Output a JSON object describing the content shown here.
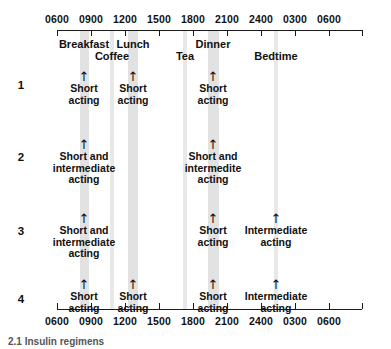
{
  "figure": {
    "caption": "2.1 Insulin regimens"
  },
  "axis": {
    "ticks": [
      {
        "label": "0600",
        "x": 57
      },
      {
        "label": "0900",
        "x": 91
      },
      {
        "label": "1200",
        "x": 125
      },
      {
        "label": "1500",
        "x": 159
      },
      {
        "label": "1800",
        "x": 193
      },
      {
        "label": "2100",
        "x": 227
      },
      {
        "label": "2400",
        "x": 261
      },
      {
        "label": "0300",
        "x": 295
      },
      {
        "label": "0600",
        "x": 329
      }
    ],
    "axis_left": 57,
    "axis_right": 362,
    "top_y": 30,
    "bottom_y": 309
  },
  "meals": [
    {
      "name": "Breakfast",
      "x": 84,
      "row": 0
    },
    {
      "name": "Coffee",
      "x": 112,
      "row": 1
    },
    {
      "name": "Lunch",
      "x": 133,
      "row": 0
    },
    {
      "name": "Tea",
      "x": 185,
      "row": 1
    },
    {
      "name": "Dinner",
      "x": 213,
      "row": 0
    },
    {
      "name": "Bedtime",
      "x": 276,
      "row": 1
    }
  ],
  "bands": [
    {
      "name": "breakfast-band",
      "x": 80,
      "width": 9,
      "tone": "solid"
    },
    {
      "name": "coffee-band",
      "x": 110,
      "width": 4,
      "tone": "soft"
    },
    {
      "name": "lunch-band",
      "x": 128,
      "width": 10,
      "tone": "solid"
    },
    {
      "name": "tea-band",
      "x": 183,
      "width": 4,
      "tone": "soft"
    },
    {
      "name": "dinner-band",
      "x": 208,
      "width": 11,
      "tone": "solid"
    },
    {
      "name": "bedtime-band",
      "x": 274,
      "width": 4,
      "tone": "soft"
    }
  ],
  "rows": [
    {
      "number": "1",
      "number_y": 85,
      "doses": [
        {
          "label": "Short\nacting",
          "x": 84,
          "y": 72
        },
        {
          "label": "Short\nacting",
          "x": 133,
          "y": 72
        },
        {
          "label": "Short\nacting",
          "x": 213,
          "y": 72
        }
      ]
    },
    {
      "number": "2",
      "number_y": 157,
      "doses": [
        {
          "label": "Short and\nintermediate\nacting",
          "x": 84,
          "y": 140
        },
        {
          "label": "Short and\nintermedite\nacting",
          "x": 213,
          "y": 140
        }
      ]
    },
    {
      "number": "3",
      "number_y": 231,
      "doses": [
        {
          "label": "Short and\nintermediate\nacting",
          "x": 84,
          "y": 214
        },
        {
          "label": "Short\nacting",
          "x": 213,
          "y": 214
        },
        {
          "label": "Intermediate\nacting",
          "x": 276,
          "y": 214
        }
      ]
    },
    {
      "number": "4",
      "number_y": 299,
      "doses": [
        {
          "label": "Short\nacting",
          "x": 84,
          "y": 280
        },
        {
          "label": "Short\nacting",
          "x": 133,
          "y": 280
        },
        {
          "label": "Short\nacting",
          "x": 213,
          "y": 280
        },
        {
          "label": "Intermediate\nacting",
          "x": 276,
          "y": 280
        }
      ]
    }
  ],
  "icons": {
    "dose_arrow": "↑"
  },
  "colors": {
    "band_solid": "#e2e2e2",
    "band_soft": "#e8e8e8",
    "axis": "#1a1a1a",
    "text": "#111111"
  }
}
